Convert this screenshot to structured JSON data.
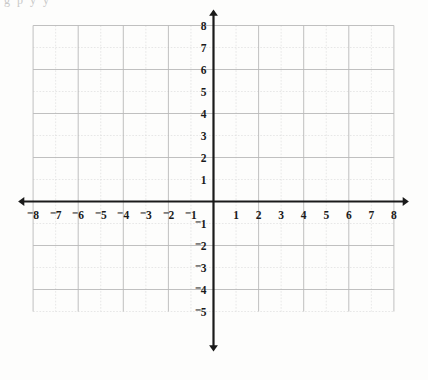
{
  "figure": {
    "top_cropped_text": "g p y y",
    "background_color": "#fdfdfc",
    "grid_color": "#b9b9b9",
    "grid_minor_color": "#d8d8d8",
    "axis_color": "#1a1a1a",
    "segment_color": "#6e6e6e"
  },
  "axes": {
    "x_label": "x",
    "y_label": "y",
    "x_ticks": [
      {
        "value": -8,
        "label": "⁻8"
      },
      {
        "value": -7,
        "label": "⁻7"
      },
      {
        "value": -6,
        "label": "⁻6"
      },
      {
        "value": -5,
        "label": "⁻5"
      },
      {
        "value": -4,
        "label": "⁻4"
      },
      {
        "value": -3,
        "label": "⁻3"
      },
      {
        "value": -2,
        "label": "⁻2"
      },
      {
        "value": -1,
        "label": "⁻1"
      },
      {
        "value": 1,
        "label": "1"
      },
      {
        "value": 2,
        "label": "2"
      },
      {
        "value": 3,
        "label": "3"
      },
      {
        "value": 4,
        "label": "4"
      },
      {
        "value": 5,
        "label": "5"
      },
      {
        "value": 6,
        "label": "6"
      },
      {
        "value": 7,
        "label": "7"
      },
      {
        "value": 8,
        "label": "8"
      }
    ],
    "y_ticks": [
      {
        "value": 8,
        "label": "8"
      },
      {
        "value": 7,
        "label": "7"
      },
      {
        "value": 6,
        "label": "6"
      },
      {
        "value": 5,
        "label": "5"
      },
      {
        "value": 4,
        "label": "4"
      },
      {
        "value": 3,
        "label": "3"
      },
      {
        "value": 2,
        "label": "2"
      },
      {
        "value": 1,
        "label": "1"
      },
      {
        "value": -1,
        "label": "⁻1"
      },
      {
        "value": -2,
        "label": "⁻2"
      },
      {
        "value": -3,
        "label": "⁻3"
      },
      {
        "value": -4,
        "label": "⁻4"
      },
      {
        "value": -5,
        "label": "⁻5"
      }
    ]
  },
  "chart_data": {
    "type": "scatter",
    "title": "",
    "xlabel": "x",
    "ylabel": "y",
    "xlim": [
      -8,
      8
    ],
    "ylim": [
      -5,
      8
    ],
    "grid": true,
    "legend": "none",
    "series": [
      {
        "name": "i",
        "label": "i",
        "x": [
          -6,
          -3
        ],
        "y": [
          5,
          7
        ],
        "slope": 0.6667,
        "label_pos": {
          "x": -4.55,
          "y": 6.55
        }
      },
      {
        "name": "j",
        "label": "j",
        "x": [
          -2,
          2
        ],
        "y": [
          3,
          4
        ],
        "slope": 0.25,
        "label_pos": {
          "x": 0.42,
          "y": 4.05
        }
      },
      {
        "name": "k",
        "label": "k",
        "x": [
          -5,
          -1
        ],
        "y": [
          2,
          1
        ],
        "slope": -0.25,
        "label_pos": {
          "x": -2.6,
          "y": 1.92
        }
      },
      {
        "name": "l",
        "label": "l",
        "x": [
          1,
          5
        ],
        "y": [
          1,
          2
        ],
        "slope": 0.25,
        "label_pos": {
          "x": 3.45,
          "y": 2.2
        }
      },
      {
        "name": "m",
        "label": "m",
        "x": [
          -5,
          -2
        ],
        "y": [
          -2,
          -4
        ],
        "slope": -0.6667,
        "label_pos": {
          "x": -3.5,
          "y": -2.28
        }
      },
      {
        "name": "n",
        "label": "n",
        "x": [
          2,
          6
        ],
        "y": [
          -3,
          -1
        ],
        "slope": 0.5,
        "label_pos": {
          "x": 3.9,
          "y": -1.55
        }
      }
    ]
  }
}
